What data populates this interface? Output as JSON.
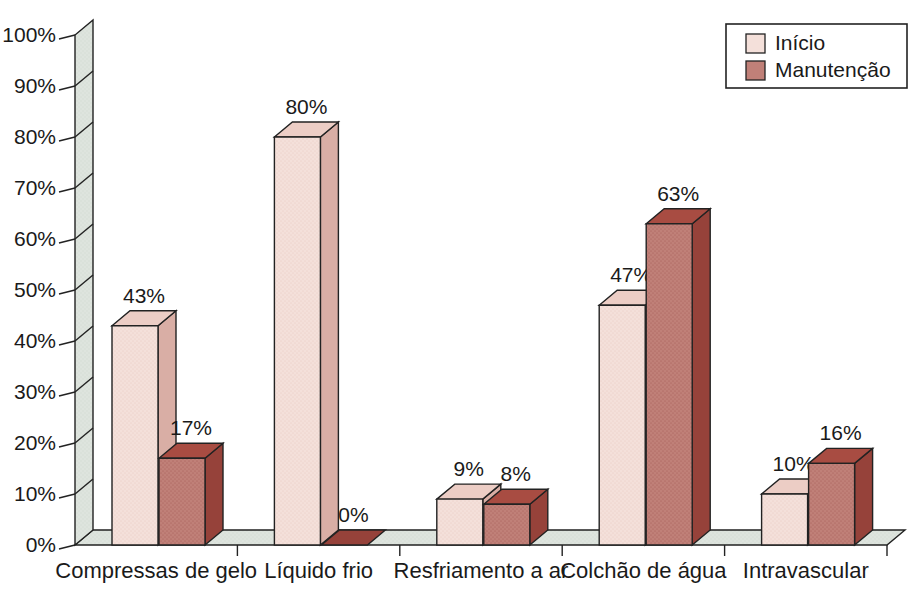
{
  "chart_data": {
    "type": "bar",
    "style": "3d-grouped",
    "title": "",
    "xlabel": "",
    "ylabel": "",
    "categories": [
      "Compressas de gelo",
      "Líquido frio",
      "Resfriamento a ar",
      "Colchão de água",
      "Intravascular"
    ],
    "series": [
      {
        "name": "Início",
        "values": [
          43,
          80,
          9,
          47,
          10
        ],
        "colors": {
          "front": "#f4e0da",
          "top": "#eccdc5",
          "side": "#d9aea5",
          "dot": "#d9b0a7"
        }
      },
      {
        "name": "Manutenção",
        "values": [
          17,
          0,
          8,
          63,
          16
        ],
        "colors": {
          "front": "#c08078",
          "top": "#a84c42",
          "side": "#96423a",
          "dot": "#8a372f"
        }
      }
    ],
    "value_suffix": "%",
    "value_labels": [
      [
        "43%",
        "80%",
        "9%",
        "47%",
        "10%"
      ],
      [
        "17%",
        "0%",
        "8%",
        "63%",
        "16%"
      ]
    ],
    "ylim": [
      0,
      100
    ],
    "ytick_step": 10,
    "ytick_labels": [
      "0%",
      "10%",
      "20%",
      "30%",
      "40%",
      "50%",
      "60%",
      "70%",
      "80%",
      "90%",
      "100%"
    ],
    "grid": false,
    "legend": {
      "position": "top-right",
      "entries": [
        "Início",
        "Manutenção"
      ]
    },
    "colors": {
      "background": "#ffffff",
      "wall": "#dee4de",
      "wall_dot": "#bccabc",
      "outline": "#222222",
      "text": "#1a1a1a"
    }
  }
}
